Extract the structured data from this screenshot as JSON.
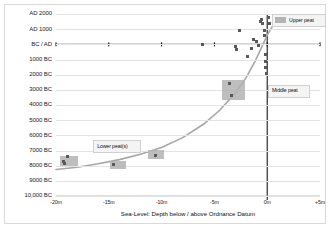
{
  "chart_data": {
    "type": "scatter",
    "title": "",
    "xlabel": "Sea-Level: Depth below / above Ordnance Datum",
    "ylabel": "",
    "grid": true,
    "xlim": [
      -20,
      5
    ],
    "ylim": [
      -10000,
      2000
    ],
    "xticks": [
      -20,
      -15,
      -10,
      -5,
      0,
      5
    ],
    "xticklabels": [
      "-20m",
      "-15m",
      "-10m",
      "-5m",
      "0m",
      "+5m"
    ],
    "yticks": [
      2000,
      1000,
      0,
      -1000,
      -2000,
      -3000,
      -4000,
      -5000,
      -6000,
      -7000,
      -8000,
      -9000,
      -10000
    ],
    "yticklabels": [
      "AD 2000",
      "AD 1000",
      "BC / AD",
      "1000 BC",
      "2000 BC",
      "3000 BC",
      "4000 BC",
      "5000 BC",
      "6000 BC",
      "7000 BC",
      "8000 BC",
      "9000 BC",
      "10,000 BC"
    ],
    "series": [
      {
        "name": "sea-level index points",
        "type": "scatter",
        "points": [
          {
            "x": -19.3,
            "y": -7700
          },
          {
            "x": -19.2,
            "y": -7850
          },
          {
            "x": -18.9,
            "y": -7400
          },
          {
            "x": -14.6,
            "y": -7950
          },
          {
            "x": -10.6,
            "y": -7300
          },
          {
            "x": -6.1,
            "y": 0
          },
          {
            "x": -3.6,
            "y": -2600
          },
          {
            "x": -3.4,
            "y": -3400
          },
          {
            "x": -3.0,
            "y": -150
          },
          {
            "x": -2.9,
            "y": -320
          },
          {
            "x": -2.6,
            "y": 900
          },
          {
            "x": -1.9,
            "y": -800
          },
          {
            "x": -1.5,
            "y": -300
          },
          {
            "x": -1.3,
            "y": 300
          },
          {
            "x": -1.0,
            "y": 200
          },
          {
            "x": -0.8,
            "y": -100
          },
          {
            "x": -0.6,
            "y": 1500
          },
          {
            "x": -0.5,
            "y": 1650
          },
          {
            "x": -0.4,
            "y": 1400
          },
          {
            "x": -0.3,
            "y": 900
          },
          {
            "x": -0.3,
            "y": 600
          },
          {
            "x": -0.2,
            "y": -700
          },
          {
            "x": -0.2,
            "y": -1100
          },
          {
            "x": -0.15,
            "y": -1500
          },
          {
            "x": -0.1,
            "y": -1900
          },
          {
            "x": 0.1,
            "y": 1750
          },
          {
            "x": 0.2,
            "y": 1350
          },
          {
            "x": 1.0,
            "y": 1800
          }
        ]
      },
      {
        "name": "peat bands",
        "type": "bands",
        "bands": [
          {
            "label": "lower-peat-a",
            "x0": -19.6,
            "x1": -17.9,
            "y0": -7350,
            "y1": -8050
          },
          {
            "label": "lower-peat-b",
            "x0": -14.9,
            "x1": -13.4,
            "y0": -7700,
            "y1": -8200
          },
          {
            "label": "lower-peat-c",
            "x0": -11.3,
            "x1": -9.8,
            "y0": -6950,
            "y1": -7550
          },
          {
            "label": "middle-peat",
            "x0": -4.3,
            "x1": -2.1,
            "y0": -2350,
            "y1": -3700
          }
        ]
      },
      {
        "name": "sea-level curve",
        "type": "line",
        "x": [
          -20.0,
          -18.0,
          -16.0,
          -14.0,
          -12.0,
          -10.0,
          -8.0,
          -6.0,
          -4.5,
          -3.0,
          -2.0,
          -1.2,
          -0.6,
          0.0,
          0.6,
          1.2
        ],
        "y": [
          -8250,
          -8100,
          -7880,
          -7600,
          -7250,
          -6800,
          -6150,
          -5250,
          -4350,
          -3200,
          -2200,
          -1200,
          -300,
          600,
          1300,
          1850
        ]
      }
    ],
    "annotations": [
      {
        "name": "upper-peat-legend",
        "text": "Upper peat",
        "x": 1.6,
        "y": 1650,
        "swatch": true
      },
      {
        "name": "middle-peat-label",
        "text": "Middle peat",
        "x": 0.35,
        "y": -3000,
        "swatch": false
      },
      {
        "name": "lower-peat-label",
        "text": "Lower peat(s)",
        "x": -16.2,
        "y": -6650,
        "swatch": false
      }
    ],
    "colors": {
      "band": "#b3b3b3",
      "point": "#595959",
      "curve": "#a6a6a6",
      "grid": "#e3e3e3",
      "axis": "#000000",
      "frame": "#d9d9d9",
      "text": "#1a1a1a"
    }
  }
}
